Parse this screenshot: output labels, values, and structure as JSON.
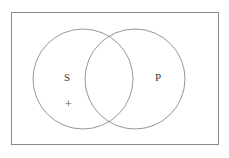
{
  "figure": {
    "kind": "venn-diagram",
    "background_color": "#ffffff",
    "line_color": "#8a8a8a",
    "text_color": "#3a3a3a",
    "mark_color": "#555555"
  },
  "universe_box": {
    "name": "universe-rectangle",
    "x": 11,
    "y": 12,
    "width": 208,
    "height": 133,
    "stroke": "#8a8a8a",
    "stroke_width": 1,
    "fill": "none"
  },
  "circles": [
    {
      "id": "circle-s",
      "label": "S",
      "cx": 83,
      "cy": 79,
      "r": 50,
      "stroke": "#8a8a8a",
      "stroke_width": 1,
      "fill": "none"
    },
    {
      "id": "circle-p",
      "label": "P",
      "cx": 135,
      "cy": 79,
      "r": 50,
      "stroke": "#8a8a8a",
      "stroke_width": 1,
      "fill": "none"
    }
  ],
  "labels": {
    "subject": "S",
    "predicate": "P",
    "existential_mark": "+"
  },
  "marks": [
    {
      "id": "mark-plus",
      "symbol": "+",
      "x": 70,
      "y": 104,
      "region": "S-only"
    }
  ]
}
